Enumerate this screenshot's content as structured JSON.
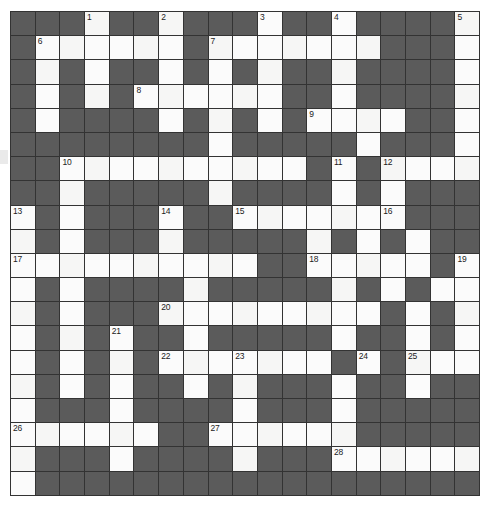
{
  "puzzle": {
    "kind": "crossword-grid",
    "title": "Crossword puzzle grid",
    "rows": 20,
    "columns": 19,
    "colors": {
      "block": "#5b5b5b",
      "open": "#fbfbfb",
      "gridline": "#333333",
      "number": "#1b1b1b",
      "page": "#ffffff"
    },
    "clue_numbers": [
      {
        "number": "1",
        "row": 0,
        "col": 3
      },
      {
        "number": "2",
        "row": 0,
        "col": 6
      },
      {
        "number": "3",
        "row": 0,
        "col": 10
      },
      {
        "number": "4",
        "row": 0,
        "col": 13
      },
      {
        "number": "5",
        "row": 0,
        "col": 18
      },
      {
        "number": "6",
        "row": 1,
        "col": 1
      },
      {
        "number": "7",
        "row": 1,
        "col": 8
      },
      {
        "number": "8",
        "row": 3,
        "col": 5
      },
      {
        "number": "9",
        "row": 4,
        "col": 12
      },
      {
        "number": "10",
        "row": 6,
        "col": 2
      },
      {
        "number": "11",
        "row": 6,
        "col": 13
      },
      {
        "number": "12",
        "row": 6,
        "col": 15
      },
      {
        "number": "13",
        "row": 8,
        "col": 0
      },
      {
        "number": "14",
        "row": 8,
        "col": 6
      },
      {
        "number": "15",
        "row": 8,
        "col": 9
      },
      {
        "number": "16",
        "row": 8,
        "col": 15
      },
      {
        "number": "17",
        "row": 10,
        "col": 0
      },
      {
        "number": "18",
        "row": 10,
        "col": 12
      },
      {
        "number": "19",
        "row": 10,
        "col": 18
      },
      {
        "number": "20",
        "row": 12,
        "col": 6
      },
      {
        "number": "21",
        "row": 13,
        "col": 4
      },
      {
        "number": "22",
        "row": 14,
        "col": 6
      },
      {
        "number": "23",
        "row": 14,
        "col": 9
      },
      {
        "number": "24",
        "row": 14,
        "col": 14
      },
      {
        "number": "25",
        "row": 14,
        "col": 16
      },
      {
        "number": "26",
        "row": 17,
        "col": 0
      },
      {
        "number": "27",
        "row": 17,
        "col": 8
      },
      {
        "number": "28",
        "row": 18,
        "col": 13
      }
    ],
    "cells": [
      [
        "block",
        "block",
        "block",
        "open",
        "block",
        "block",
        "open",
        "block",
        "block",
        "block",
        "open",
        "block",
        "block",
        "open",
        "block",
        "block",
        "block",
        "block",
        "open"
      ],
      [
        "block",
        "open",
        "open",
        "open",
        "open",
        "open",
        "open",
        "block",
        "open",
        "open",
        "open",
        "open",
        "open",
        "open",
        "open",
        "block",
        "block",
        "block",
        "open"
      ],
      [
        "block",
        "open",
        "block",
        "open",
        "block",
        "block",
        "open",
        "block",
        "open",
        "block",
        "open",
        "block",
        "block",
        "open",
        "block",
        "block",
        "block",
        "block",
        "open"
      ],
      [
        "block",
        "open",
        "block",
        "open",
        "block",
        "open",
        "open",
        "open",
        "open",
        "open",
        "open",
        "block",
        "block",
        "open",
        "block",
        "block",
        "block",
        "block",
        "open"
      ],
      [
        "block",
        "open",
        "block",
        "block",
        "block",
        "block",
        "open",
        "block",
        "open",
        "block",
        "open",
        "block",
        "open",
        "open",
        "open",
        "open",
        "block",
        "block",
        "open"
      ],
      [
        "block",
        "block",
        "block",
        "block",
        "block",
        "block",
        "block",
        "block",
        "open",
        "block",
        "block",
        "block",
        "block",
        "block",
        "open",
        "block",
        "block",
        "block",
        "open"
      ],
      [
        "block",
        "block",
        "open",
        "open",
        "open",
        "open",
        "open",
        "open",
        "open",
        "open",
        "open",
        "open",
        "block",
        "open",
        "block",
        "open",
        "open",
        "open",
        "open"
      ],
      [
        "block",
        "block",
        "open",
        "block",
        "block",
        "block",
        "block",
        "block",
        "open",
        "block",
        "block",
        "block",
        "block",
        "open",
        "block",
        "open",
        "block",
        "block",
        "block"
      ],
      [
        "open",
        "block",
        "open",
        "block",
        "block",
        "block",
        "open",
        "block",
        "block",
        "open",
        "open",
        "open",
        "open",
        "open",
        "open",
        "open",
        "block",
        "block",
        "block"
      ],
      [
        "open",
        "block",
        "open",
        "block",
        "block",
        "block",
        "open",
        "block",
        "block",
        "block",
        "block",
        "block",
        "open",
        "block",
        "open",
        "block",
        "open",
        "block",
        "block"
      ],
      [
        "open",
        "open",
        "open",
        "open",
        "open",
        "open",
        "open",
        "open",
        "open",
        "open",
        "block",
        "block",
        "open",
        "open",
        "open",
        "open",
        "open",
        "block",
        "open"
      ],
      [
        "open",
        "block",
        "open",
        "block",
        "block",
        "block",
        "block",
        "open",
        "block",
        "block",
        "block",
        "block",
        "block",
        "open",
        "block",
        "open",
        "block",
        "open",
        "open"
      ],
      [
        "open",
        "block",
        "open",
        "block",
        "block",
        "block",
        "open",
        "open",
        "open",
        "open",
        "open",
        "open",
        "open",
        "open",
        "open",
        "block",
        "open",
        "block",
        "open"
      ],
      [
        "open",
        "block",
        "open",
        "block",
        "open",
        "block",
        "block",
        "open",
        "block",
        "block",
        "block",
        "block",
        "block",
        "open",
        "block",
        "block",
        "open",
        "block",
        "open"
      ],
      [
        "open",
        "block",
        "open",
        "block",
        "open",
        "block",
        "open",
        "open",
        "open",
        "open",
        "open",
        "open",
        "open",
        "block",
        "open",
        "block",
        "open",
        "open",
        "open"
      ],
      [
        "open",
        "block",
        "open",
        "block",
        "open",
        "block",
        "block",
        "open",
        "block",
        "open",
        "block",
        "block",
        "block",
        "open",
        "block",
        "block",
        "open",
        "block",
        "block"
      ],
      [
        "open",
        "block",
        "block",
        "block",
        "open",
        "block",
        "block",
        "block",
        "block",
        "open",
        "block",
        "block",
        "block",
        "open",
        "block",
        "block",
        "block",
        "block",
        "block"
      ],
      [
        "open",
        "open",
        "open",
        "open",
        "open",
        "open",
        "block",
        "block",
        "open",
        "open",
        "open",
        "open",
        "open",
        "open",
        "block",
        "block",
        "block",
        "block",
        "block"
      ],
      [
        "open",
        "block",
        "block",
        "block",
        "open",
        "block",
        "block",
        "block",
        "block",
        "open",
        "block",
        "block",
        "block",
        "open",
        "open",
        "open",
        "open",
        "open",
        "open"
      ],
      [
        "open",
        "block",
        "block",
        "block",
        "block",
        "block",
        "block",
        "block",
        "block",
        "block",
        "block",
        "block",
        "block",
        "block",
        "block",
        "block",
        "block",
        "block",
        "block"
      ]
    ]
  }
}
